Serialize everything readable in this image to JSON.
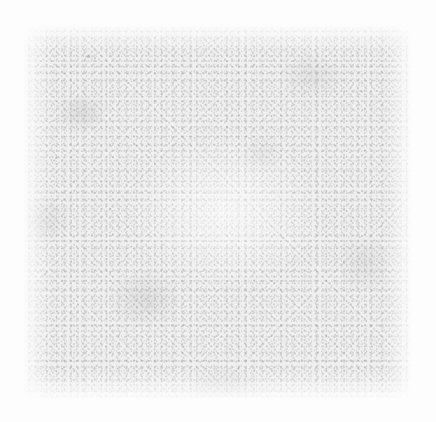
{
  "image": {
    "kind": "texture-swatch",
    "description": "Blank grainy light-grey textured square on a near-white background",
    "width": 436,
    "height": 422,
    "background_color": "#fdfdfd",
    "text_content": "",
    "has_text": false,
    "has_ui_elements": false
  },
  "texture_square": {
    "left": 24,
    "top": 26,
    "width": 388,
    "height": 372,
    "base_color": "#efefef",
    "grain_color": "#969696",
    "highlight_color": "#ffffff",
    "edge_color": "#fdfdfd"
  },
  "specks": [
    {
      "left": 63,
      "top": 29,
      "size": 2.5,
      "opacity": 0.4
    },
    {
      "left": 70,
      "top": 31,
      "size": 2.0,
      "opacity": 0.34
    },
    {
      "left": 31,
      "top": 131,
      "size": 2.0,
      "opacity": 0.3
    },
    {
      "left": 20,
      "top": 247,
      "size": 1.8,
      "opacity": 0.26
    },
    {
      "left": 92,
      "top": 284,
      "size": 2.2,
      "opacity": 0.32
    },
    {
      "left": 205,
      "top": 322,
      "size": 2.0,
      "opacity": 0.3
    },
    {
      "left": 137,
      "top": 218,
      "size": 1.8,
      "opacity": 0.24
    },
    {
      "left": 258,
      "top": 211,
      "size": 1.8,
      "opacity": 0.26
    },
    {
      "left": 336,
      "top": 64,
      "size": 1.8,
      "opacity": 0.24
    },
    {
      "left": 392,
      "top": 126,
      "size": 2.0,
      "opacity": 0.28
    },
    {
      "left": 400,
      "top": 352,
      "size": 2.0,
      "opacity": 0.28
    },
    {
      "left": 152,
      "top": 370,
      "size": 1.8,
      "opacity": 0.26
    }
  ]
}
